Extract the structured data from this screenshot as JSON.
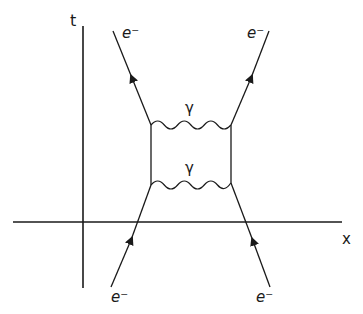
{
  "diagram": {
    "type": "feynman",
    "axes": {
      "time_label": "t",
      "space_label": "x"
    },
    "particles": {
      "incoming_left": "e⁻",
      "incoming_right": "e⁻",
      "outgoing_left": "e⁻",
      "outgoing_right": "e⁻"
    },
    "photons": {
      "upper": "γ",
      "lower": "γ"
    },
    "colors": {
      "line": "#1a1a1a",
      "background": "#ffffff"
    }
  }
}
